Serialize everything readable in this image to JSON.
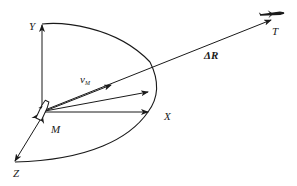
{
  "diagram": {
    "type": "coordinate-system-vector-diagram",
    "colors": {
      "stroke": "#1a1a1a",
      "background": "#ffffff"
    },
    "labels": {
      "y_axis": "Y",
      "x_axis": "X",
      "z_axis": "Z",
      "missile": "M",
      "velocity": "v",
      "velocity_sub": "M",
      "range": "ΔR",
      "target": "T"
    },
    "icons": {
      "missile": "missile-icon",
      "target": "aircraft-icon"
    }
  }
}
